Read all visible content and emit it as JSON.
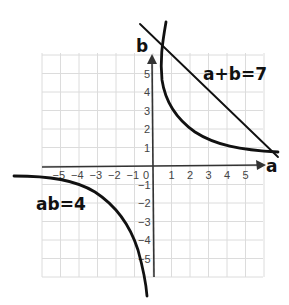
{
  "chart_data": {
    "type": "line",
    "title": "",
    "xlabel": "a",
    "ylabel": "b",
    "xlim": [
      -6,
      6
    ],
    "ylim": [
      -6,
      6
    ],
    "grid": true,
    "x_ticks": [
      "-5",
      "-4",
      "-3",
      "-2",
      "-1",
      "0",
      "1",
      "2",
      "3",
      "4",
      "5"
    ],
    "y_ticks": [
      "5",
      "4",
      "3",
      "2",
      "1",
      "-1",
      "-2",
      "-3",
      "-4",
      "-5"
    ],
    "series": [
      {
        "name": "a+b=7",
        "kind": "line",
        "points": [
          [
            0.7,
            6.3
          ],
          [
            6.5,
            0.5
          ]
        ]
      },
      {
        "name": "ab=4",
        "kind": "hyperbola",
        "branches": [
          [
            [
              0.55,
              7.0
            ],
            [
              0.7,
              6
            ],
            [
              1,
              4
            ],
            [
              1.5,
              2.7
            ],
            [
              2,
              2
            ],
            [
              3,
              1.35
            ],
            [
              4,
              1.0
            ],
            [
              5,
              0.85
            ],
            [
              6.5,
              0.65
            ]
          ],
          [
            [
              -7.5,
              -0.55
            ],
            [
              -5,
              -0.75
            ],
            [
              -4,
              -0.95
            ],
            [
              -3,
              -1.3
            ],
            [
              -2,
              -2
            ],
            [
              -1.5,
              -2.7
            ],
            [
              -1,
              -4
            ],
            [
              -0.75,
              -5.3
            ],
            [
              -0.6,
              -6.6
            ]
          ]
        ]
      }
    ],
    "annotations": [
      {
        "text": "a+b=7",
        "position": "upper right"
      },
      {
        "text": "ab=4",
        "position": "lower left"
      }
    ]
  },
  "labels": {
    "x_axis": "a",
    "y_axis": "b",
    "line_eq": "a+b=7",
    "hyperbola_eq": "ab=4",
    "x_ticks": [
      "−5",
      "−4",
      "−3",
      "−2",
      "−1",
      "0",
      "1",
      "2",
      "3",
      "4",
      "5"
    ],
    "y_ticks_pos": [
      "5",
      "4",
      "3",
      "2",
      "1"
    ],
    "y_ticks_neg": [
      "−1",
      "−2",
      "−3",
      "−4",
      "−5"
    ]
  }
}
